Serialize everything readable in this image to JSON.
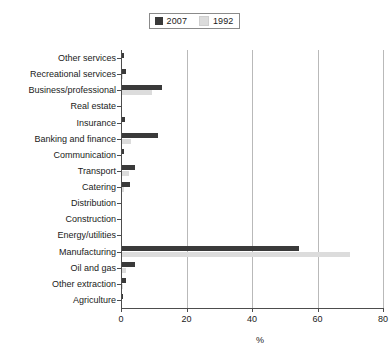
{
  "chart_data": {
    "type": "bar",
    "orientation": "horizontal",
    "title": "",
    "xlabel": "%",
    "ylabel": "",
    "xlim": [
      0,
      80
    ],
    "xticks": [
      0,
      20,
      40,
      60,
      80
    ],
    "grid": "vertical",
    "legend_position": "top-center",
    "categories": [
      "Other services",
      "Recreational services",
      "Business/professional",
      "Real estate",
      "Insurance",
      "Banking and finance",
      "Communication",
      "Transport",
      "Catering",
      "Distribution",
      "Construction",
      "Energy/utilities",
      "Manufacturing",
      "Oil and gas",
      "Other extraction",
      "Agriculture"
    ],
    "series": [
      {
        "name": "2007",
        "color": "#3a3a3a",
        "values": [
          1.0,
          1.4,
          12.5,
          0.4,
          1.1,
          11.3,
          0.9,
          4.2,
          2.6,
          0.3,
          0.2,
          0.3,
          54.5,
          4.3,
          1.6,
          0.7
        ]
      },
      {
        "name": "1992",
        "color": "#dcdcdc",
        "values": [
          0.3,
          0.5,
          9.5,
          0.2,
          0.4,
          3.0,
          0.3,
          2.3,
          0.8,
          0.2,
          0.2,
          0.3,
          69.8,
          1.4,
          0.6,
          0.4
        ]
      }
    ]
  },
  "legend": {
    "entries": [
      {
        "label": "2007",
        "color": "#3a3a3a"
      },
      {
        "label": "1992",
        "color": "#dcdcdc"
      }
    ]
  },
  "axis": {
    "x_title": "%",
    "x_tick_labels": [
      "0",
      "20",
      "40",
      "60",
      "80"
    ]
  },
  "colors": {
    "series_2007": "#3a3a3a",
    "series_1992": "#dcdcdc",
    "gridline": "#b9b9b9",
    "axis": "#4d4d4d",
    "background": "#ffffff",
    "text": "#1a1a1a"
  }
}
